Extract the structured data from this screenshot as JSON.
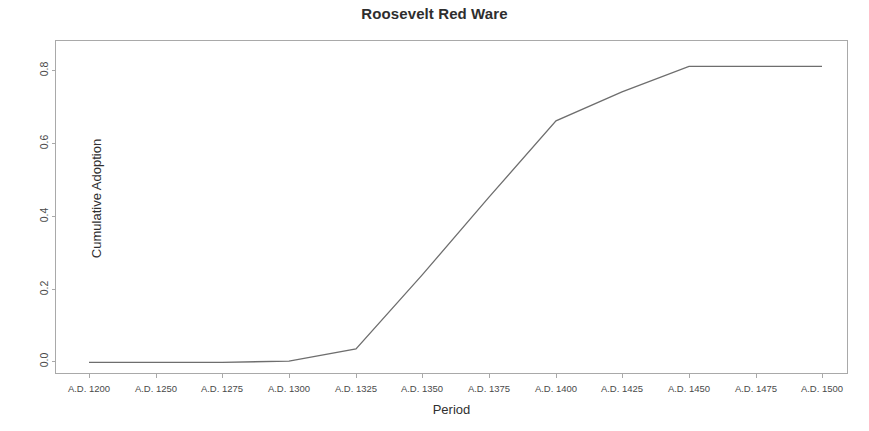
{
  "chart_data": {
    "type": "line",
    "title": "Roosevelt Red Ware",
    "xlabel": "Period",
    "ylabel": "Cumulative Adoption",
    "categories": [
      "A.D. 1200",
      "A.D. 1250",
      "A.D. 1275",
      "A.D. 1300",
      "A.D. 1325",
      "A.D. 1350",
      "A.D. 1375",
      "A.D. 1400",
      "A.D. 1425",
      "A.D. 1450",
      "A.D. 1475",
      "A.D. 1500"
    ],
    "values": [
      0.005,
      0.005,
      0.005,
      0.008,
      0.042,
      0.245,
      0.46,
      0.67,
      0.75,
      0.82,
      0.82,
      0.82
    ],
    "series": [
      {
        "name": "Cumulative Adoption",
        "values": [
          0.005,
          0.005,
          0.005,
          0.008,
          0.042,
          0.245,
          0.46,
          0.67,
          0.75,
          0.82,
          0.82,
          0.82
        ]
      }
    ],
    "ylim": [
      -0.03,
      0.89
    ],
    "xlim": [
      0,
      11
    ],
    "yticks": [
      "0.0",
      "0.2",
      "0.4",
      "0.6",
      "0.8"
    ],
    "ytick_values": [
      0.0,
      0.2,
      0.4,
      0.6,
      0.8
    ],
    "grid": false,
    "legend": "none",
    "line_color": "#6e6e6e",
    "frame_color": "#a9a9a9"
  }
}
